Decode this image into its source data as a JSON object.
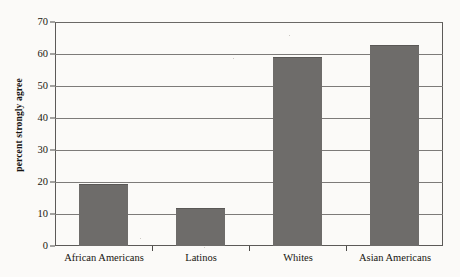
{
  "chart_data": {
    "type": "bar",
    "title": "",
    "xlabel": "",
    "ylabel": "percent strongly agree",
    "categories": [
      "African Americans",
      "Latinos",
      "Whites",
      "Asian Americans"
    ],
    "values": [
      19,
      11.7,
      58.7,
      62.5
    ],
    "ylim": [
      0,
      70
    ],
    "ytick_step": 10,
    "yticks": [
      0,
      10,
      20,
      30,
      40,
      50,
      60,
      70
    ],
    "ytick_labels": [
      "0",
      "10",
      "20",
      "30",
      "40",
      "50",
      "60",
      "70"
    ],
    "grid": true,
    "grid_axis": "y",
    "legend": false,
    "legend_position": "none",
    "bar_color": "#6e6c6a",
    "axis_color": "#4d4b49",
    "grid_color": "#7d7b79",
    "background_color": "#fbfaf8",
    "text_color": "#17150f"
  }
}
